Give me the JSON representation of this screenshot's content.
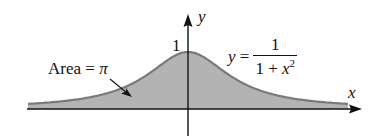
{
  "chart_data": {
    "type": "area",
    "title": "",
    "function": "y = 1/(1 + x^2)",
    "xlabel": "x",
    "ylabel": "y",
    "x": [
      -3.2,
      -3.0,
      -2.5,
      -2.0,
      -1.5,
      -1.0,
      -0.5,
      0.0,
      0.5,
      1.0,
      1.5,
      2.0,
      2.5,
      3.0,
      3.2
    ],
    "values": [
      0.089,
      0.1,
      0.138,
      0.2,
      0.308,
      0.5,
      0.8,
      1.0,
      0.8,
      0.5,
      0.308,
      0.2,
      0.138,
      0.1,
      0.089
    ],
    "ylim": [
      0,
      1
    ],
    "grid": false,
    "legend": "none",
    "annotations": [
      {
        "text": "1",
        "position": "y-axis tick at y=1"
      },
      {
        "text": "Area = π",
        "arrow_to": "shaded region left of y-axis"
      },
      {
        "text": "y = 1/(1 + x²)",
        "position": "right of peak"
      }
    ],
    "fill_color": "#b3b3b3",
    "line_color": "#7a7a7a"
  },
  "labels": {
    "y_axis": "y",
    "x_axis": "x",
    "peak": "1",
    "area_prefix": "Area = ",
    "area_value": "π",
    "eq_lhs": "y",
    "eq_equals": " =",
    "eq_numerator": "1",
    "eq_den_prefix": "1 + ",
    "eq_den_var": "x",
    "eq_den_exp": "2"
  }
}
